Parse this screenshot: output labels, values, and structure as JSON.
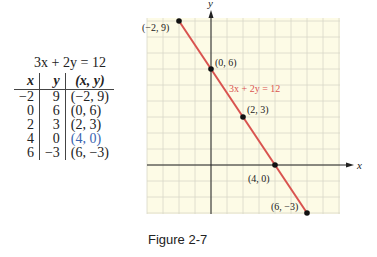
{
  "table": {
    "title": "3x + 2y = 12",
    "headers": [
      "x",
      "y",
      "(x, y)"
    ],
    "rows": [
      {
        "x": "−2",
        "y": "9",
        "pt": "(−2, 9)"
      },
      {
        "x": "0",
        "y": "6",
        "pt": "(0, 6)"
      },
      {
        "x": "2",
        "y": "3",
        "pt": "(2, 3)"
      },
      {
        "x": "4",
        "y": "0",
        "pt": "(4, 0)"
      },
      {
        "x": "6",
        "y": "−3",
        "pt": "(6, −3)"
      }
    ]
  },
  "caption": "Figure 2-7",
  "chart_data": {
    "type": "line",
    "title": "",
    "xlabel": "x",
    "ylabel": "y",
    "xlim": [
      -4,
      8
    ],
    "ylim": [
      -3,
      9
    ],
    "grid": true,
    "series": [
      {
        "name": "3x + 2y = 12",
        "x": [
          -2,
          0,
          2,
          4,
          6
        ],
        "y": [
          9,
          6,
          3,
          0,
          -3
        ],
        "color": "#d9534f"
      }
    ],
    "annotations": [
      "(−2, 9)",
      "(0, 6)",
      "(2, 3)",
      "(4, 0)",
      "(6, −3)",
      "3x + 2y = 12"
    ]
  },
  "colors": {
    "grid_bg": "#fdfbe6",
    "grid_line": "#d8d8c8",
    "line": "#d9534f",
    "axis": "#222222"
  }
}
